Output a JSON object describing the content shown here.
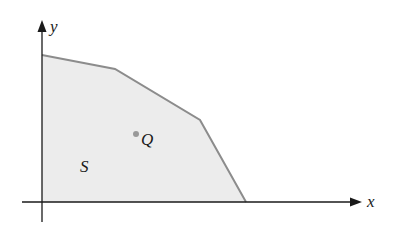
{
  "figure": {
    "type": "region-in-plane",
    "axes": {
      "x_label": "x",
      "y_label": "y"
    },
    "region": {
      "label": "S",
      "fill_color": "#ececec",
      "edge_color": "#8c8c8c",
      "vertices": [
        [
          42,
          55
        ],
        [
          115,
          69
        ],
        [
          200,
          120
        ],
        [
          246,
          202
        ],
        [
          42,
          202
        ]
      ]
    },
    "point": {
      "label": "Q",
      "color": "#999999",
      "position": [
        136,
        134
      ]
    },
    "axis_color": "#1a1a1a"
  }
}
